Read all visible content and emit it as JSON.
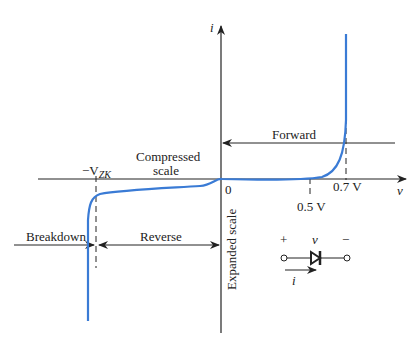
{
  "diagram": {
    "axes": {
      "x_label": "v",
      "y_label": "i",
      "origin_label": "0"
    },
    "ticks": {
      "forward_threshold_low": "0.5 V",
      "forward_threshold_high": "0.7 V",
      "zener": "−V",
      "zener_sub": "ZK"
    },
    "regions": {
      "forward": "Forward",
      "reverse": "Reverse",
      "breakdown": "Breakdown",
      "compressed_line1": "Compressed",
      "compressed_line2": "scale",
      "expanded": "Expanded scale"
    },
    "symbol": {
      "plus": "+",
      "minus": "−",
      "voltage": "v",
      "current": "i"
    },
    "colors": {
      "curve": "#3a7bd5",
      "axes": "#222222"
    }
  }
}
